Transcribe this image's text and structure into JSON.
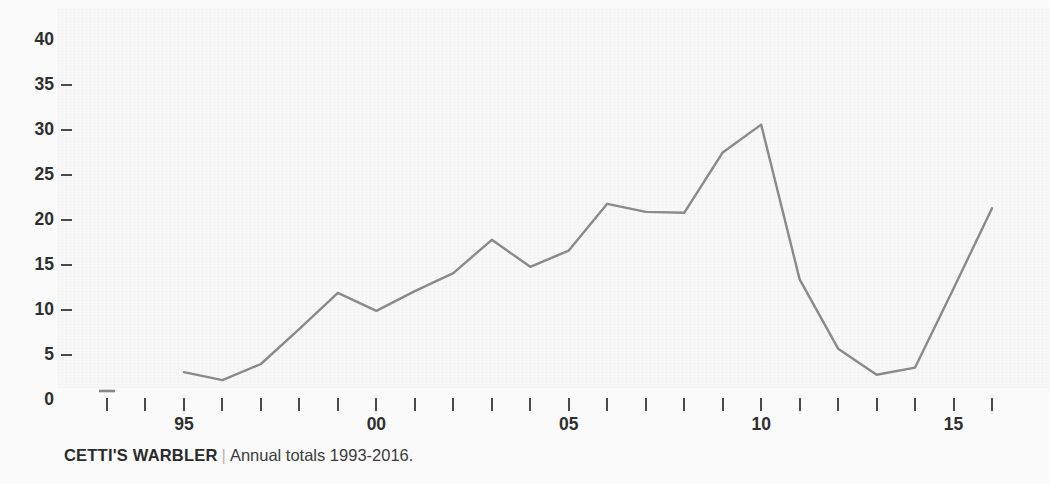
{
  "caption": {
    "species": "CETTI'S WARBLER",
    "separator": "|",
    "description": "Annual totals 1993-2016."
  },
  "clipped_title_remnant": "",
  "colors": {
    "background": "#fafafa",
    "plot_background": "#f8f8f8",
    "line": "#8a8a8a",
    "axis_text": "#2f2f2f",
    "tick_mark": "#4a4a4a",
    "caption_separator": "#b4b4b4"
  },
  "chart_data": {
    "type": "line",
    "title": "",
    "subtitle": "",
    "xlabel": "",
    "ylabel": "",
    "xlim": [
      1993,
      2016
    ],
    "ylim": [
      0,
      40
    ],
    "grid": false,
    "legend": false,
    "y_ticks": [
      0,
      5,
      10,
      15,
      20,
      25,
      30,
      35,
      40
    ],
    "y_tick_labels": [
      "0",
      "5",
      "10",
      "15",
      "20",
      "25",
      "30",
      "35",
      "40"
    ],
    "x_ticks": [
      1993,
      1994,
      1995,
      1996,
      1997,
      1998,
      1999,
      2000,
      2001,
      2002,
      2003,
      2004,
      2005,
      2006,
      2007,
      2008,
      2009,
      2010,
      2011,
      2012,
      2013,
      2014,
      2015,
      2016
    ],
    "x_tick_labels": [
      {
        "x": 1995,
        "label": "95"
      },
      {
        "x": 2000,
        "label": "00"
      },
      {
        "x": 2005,
        "label": "05"
      },
      {
        "x": 2010,
        "label": "10"
      },
      {
        "x": 2015,
        "label": "15"
      }
    ],
    "series": [
      {
        "name": "Annual totals",
        "x": [
          1993,
          1995,
          1996,
          1997,
          1998,
          1999,
          2000,
          2001,
          2002,
          2003,
          2004,
          2005,
          2006,
          2007,
          2008,
          2009,
          2010,
          2011,
          2012,
          2013,
          2014,
          2015,
          2016
        ],
        "values": [
          1.0,
          3.1,
          2.2,
          4.0,
          7.9,
          11.9,
          9.9,
          12.1,
          14.1,
          17.8,
          14.8,
          16.6,
          21.8,
          20.9,
          20.8,
          27.5,
          30.6,
          13.4,
          5.7,
          2.8,
          3.6,
          12.4,
          21.3
        ]
      }
    ]
  }
}
